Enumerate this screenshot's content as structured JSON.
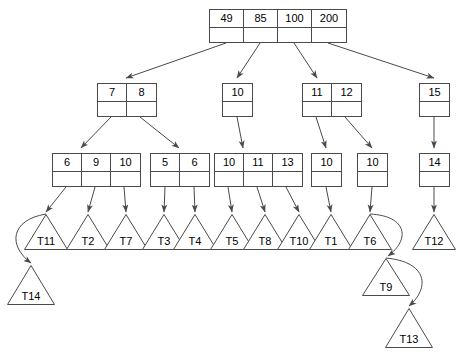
{
  "diagram": {
    "type": "tree-diagram",
    "stroke_color": "#4a4a4a",
    "text_color": "#000000",
    "background_color": "#ffffff"
  },
  "nodes": [
    {
      "id": "root",
      "keys": [
        "49",
        "85",
        "100",
        "200"
      ],
      "x": 209,
      "y": 9,
      "cell_w": 34,
      "level": 0
    },
    {
      "id": "n-7-8",
      "keys": [
        "7",
        "8"
      ],
      "x": 97,
      "y": 83,
      "cell_w": 29,
      "level": 1
    },
    {
      "id": "n-10-a",
      "keys": [
        "10"
      ],
      "x": 222,
      "y": 83,
      "cell_w": 29,
      "level": 1
    },
    {
      "id": "n-11-12",
      "keys": [
        "11",
        "12"
      ],
      "x": 302,
      "y": 83,
      "cell_w": 29,
      "level": 1
    },
    {
      "id": "n-15",
      "keys": [
        "15"
      ],
      "x": 419,
      "y": 83,
      "cell_w": 29,
      "level": 1
    },
    {
      "id": "n-6-9-10",
      "keys": [
        "6",
        "9",
        "10"
      ],
      "x": 52,
      "y": 153,
      "cell_w": 29,
      "level": 2
    },
    {
      "id": "n-5-6",
      "keys": [
        "5",
        "6"
      ],
      "x": 150,
      "y": 153,
      "cell_w": 29,
      "level": 2
    },
    {
      "id": "n-10-11-13",
      "keys": [
        "10",
        "11",
        "13"
      ],
      "x": 214,
      "y": 153,
      "cell_w": 29,
      "level": 2
    },
    {
      "id": "n-10-b",
      "keys": [
        "10"
      ],
      "x": 311,
      "y": 153,
      "cell_w": 29,
      "level": 2
    },
    {
      "id": "n-10-c",
      "keys": [
        "10"
      ],
      "x": 357,
      "y": 153,
      "cell_w": 29,
      "level": 2
    },
    {
      "id": "n-14",
      "keys": [
        "14"
      ],
      "x": 419,
      "y": 153,
      "cell_w": 29,
      "level": 2
    }
  ],
  "triangles": [
    {
      "id": "T11",
      "label": "T11",
      "cx": 46,
      "apex_y": 214,
      "base_y": 250,
      "half_w": 22
    },
    {
      "id": "T2",
      "label": "T2",
      "cx": 88,
      "apex_y": 214,
      "base_y": 250,
      "half_w": 22
    },
    {
      "id": "T7",
      "label": "T7",
      "cx": 126,
      "apex_y": 214,
      "base_y": 250,
      "half_w": 22
    },
    {
      "id": "T3",
      "label": "T3",
      "cx": 164,
      "apex_y": 214,
      "base_y": 250,
      "half_w": 22
    },
    {
      "id": "T4",
      "label": "T4",
      "cx": 195,
      "apex_y": 214,
      "base_y": 250,
      "half_w": 22
    },
    {
      "id": "T5",
      "label": "T5",
      "cx": 232,
      "apex_y": 214,
      "base_y": 250,
      "half_w": 22
    },
    {
      "id": "T8",
      "label": "T8",
      "cx": 265,
      "apex_y": 214,
      "base_y": 250,
      "half_w": 22
    },
    {
      "id": "T10",
      "label": "T10",
      "cx": 299,
      "apex_y": 214,
      "base_y": 250,
      "half_w": 22
    },
    {
      "id": "T1",
      "label": "T1",
      "cx": 331,
      "apex_y": 214,
      "base_y": 250,
      "half_w": 22
    },
    {
      "id": "T6",
      "label": "T6",
      "cx": 370,
      "apex_y": 214,
      "base_y": 250,
      "half_w": 22
    },
    {
      "id": "T12",
      "label": "T12",
      "cx": 434,
      "apex_y": 214,
      "base_y": 250,
      "half_w": 22
    },
    {
      "id": "T14",
      "label": "T14",
      "cx": 31,
      "apex_y": 265,
      "base_y": 305,
      "half_w": 24
    },
    {
      "id": "T9",
      "label": "T9",
      "cx": 386,
      "apex_y": 258,
      "base_y": 296,
      "half_w": 24
    },
    {
      "id": "T13",
      "label": "T13",
      "cx": 409,
      "apex_y": 308,
      "base_y": 348,
      "half_w": 24
    }
  ],
  "edges": [
    {
      "from": "root",
      "to": "n-7-8",
      "x1": 226,
      "y1": 43,
      "x2": 126,
      "y2": 78
    },
    {
      "from": "root",
      "to": "n-10-a",
      "x1": 260,
      "y1": 43,
      "x2": 237,
      "y2": 78
    },
    {
      "from": "root",
      "to": "n-11-12",
      "x1": 294,
      "y1": 43,
      "x2": 317,
      "y2": 78
    },
    {
      "from": "root",
      "to": "n-15",
      "x1": 328,
      "y1": 43,
      "x2": 434,
      "y2": 78
    },
    {
      "from": "n-7-8",
      "to": "n-6-9-10",
      "x1": 111,
      "y1": 117,
      "x2": 81,
      "y2": 148
    },
    {
      "from": "n-7-8",
      "to": "n-5-6",
      "x1": 140,
      "y1": 117,
      "x2": 179,
      "y2": 148
    },
    {
      "from": "n-10-a",
      "to": "n-10-11-13",
      "x1": 237,
      "y1": 117,
      "x2": 243,
      "y2": 148
    },
    {
      "from": "n-11-12",
      "to": "n-10-b",
      "x1": 316,
      "y1": 117,
      "x2": 326,
      "y2": 148
    },
    {
      "from": "n-11-12",
      "to": "n-10-c",
      "x1": 345,
      "y1": 117,
      "x2": 372,
      "y2": 148
    },
    {
      "from": "n-15",
      "to": "n-14",
      "x1": 434,
      "y1": 117,
      "x2": 434,
      "y2": 148
    },
    {
      "from": "n-6-9-10",
      "to": "T11",
      "x1": 66,
      "y1": 187,
      "x2": 46,
      "y2": 212
    },
    {
      "from": "n-6-9-10",
      "to": "T2",
      "x1": 95,
      "y1": 187,
      "x2": 88,
      "y2": 212
    },
    {
      "from": "n-6-9-10",
      "to": "T7",
      "x1": 124,
      "y1": 187,
      "x2": 126,
      "y2": 212
    },
    {
      "from": "n-5-6",
      "to": "T3",
      "x1": 165,
      "y1": 187,
      "x2": 164,
      "y2": 212
    },
    {
      "from": "n-5-6",
      "to": "T4",
      "x1": 194,
      "y1": 187,
      "x2": 195,
      "y2": 212
    },
    {
      "from": "n-10-11-13",
      "to": "T5",
      "x1": 228,
      "y1": 187,
      "x2": 232,
      "y2": 212
    },
    {
      "from": "n-10-11-13",
      "to": "T8",
      "x1": 257,
      "y1": 187,
      "x2": 265,
      "y2": 212
    },
    {
      "from": "n-10-11-13",
      "to": "T10",
      "x1": 286,
      "y1": 187,
      "x2": 299,
      "y2": 212
    },
    {
      "from": "n-10-b",
      "to": "T1",
      "x1": 326,
      "y1": 187,
      "x2": 331,
      "y2": 212
    },
    {
      "from": "n-10-c",
      "to": "T6",
      "x1": 372,
      "y1": 187,
      "x2": 370,
      "y2": 212
    },
    {
      "from": "n-14",
      "to": "T12",
      "x1": 434,
      "y1": 187,
      "x2": 434,
      "y2": 212
    }
  ],
  "curved_links": [
    {
      "id": "T11-to-T14",
      "from": "T11",
      "to": "T14",
      "path": "M 46 214 C 10 220, 8 246, 31 263"
    },
    {
      "id": "T6-to-T9",
      "from": "T6",
      "to": "T9",
      "path": "M 370 214 C 408 216, 410 240, 388 256"
    },
    {
      "id": "T9-to-T13",
      "from": "T9",
      "to": "T13",
      "path": "M 386 258 C 428 262, 430 288, 409 306"
    }
  ]
}
